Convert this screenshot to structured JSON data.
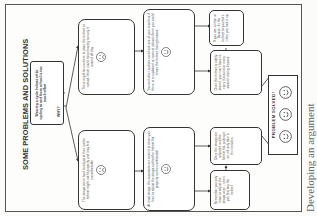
{
  "diagram": {
    "title": "SOME PROBLEMS AND SOLUTIONS",
    "start": "Wearing a cycle helmet while cycling to and from school is too much effort",
    "why_label": "WHY?",
    "problems": [
      {
        "text": "There might be nowhere to store the helmet at school which could mean having to carry it around all day",
        "face": "sad"
      },
      {
        "text": "The straps seem hard to adjust at first, so the helmet might not fit properly and may feel uncomfortable",
        "face": "sad"
      }
    ],
    "solutions": [
      {
        "text": "You and other cyclists could ask one of your teachers if there is a cupboard or room at school where you could leave the helmet during lessons",
        "face": "happy"
      },
      {
        "text": "At most shops, the assistants are trained to show you how to adjust the straps so that the helmet fits properly and is comfortable",
        "face": "happy"
      }
    ],
    "steps": [
      {
        "text": "If you use a chair or Dvorak, fix the helmet to your bike when you lock it up"
      },
      {
        "text": "Once the helmet is safely stored, you won't have to carry it around or worry about it during lessons"
      },
      {
        "text": "Once the straps are adjusted and the helmet fits, putting it on will only take a few minutes"
      },
      {
        "text": "Remember you only have to adjust the straps once - when you first buy the helmet"
      }
    ],
    "result": {
      "label": "PROBLEM SOLVED!",
      "faces": [
        "happy",
        "happy",
        "happy"
      ]
    },
    "caption": "Developing an argument"
  },
  "colors": {
    "line": "#333333",
    "text": "#444444",
    "background": "#fbfbfa"
  }
}
